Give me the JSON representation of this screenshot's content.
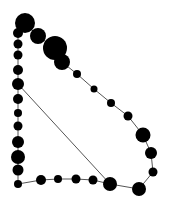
{
  "diagram": {
    "type": "node-link graph",
    "background": "#ffffff",
    "node_color": "#000000",
    "edge_color": "#555555",
    "nodes": [
      {
        "id": 0,
        "x": 25,
        "y": 23,
        "r": 10
      },
      {
        "id": 1,
        "x": 18,
        "y": 33,
        "r": 5
      },
      {
        "id": 2,
        "x": 18,
        "y": 44,
        "r": 4.5
      },
      {
        "id": 3,
        "x": 18,
        "y": 55,
        "r": 4.5
      },
      {
        "id": 4,
        "x": 18,
        "y": 70,
        "r": 5
      },
      {
        "id": 5,
        "x": 18,
        "y": 84,
        "r": 6
      },
      {
        "id": 6,
        "x": 18,
        "y": 99,
        "r": 5
      },
      {
        "id": 7,
        "x": 18,
        "y": 113,
        "r": 4
      },
      {
        "id": 8,
        "x": 18,
        "y": 126,
        "r": 4.5
      },
      {
        "id": 9,
        "x": 18,
        "y": 142,
        "r": 6
      },
      {
        "id": 10,
        "x": 18,
        "y": 157,
        "r": 7
      },
      {
        "id": 11,
        "x": 18,
        "y": 170,
        "r": 5.5
      },
      {
        "id": 12,
        "x": 18,
        "y": 184,
        "r": 4
      },
      {
        "id": 13,
        "x": 41,
        "y": 180,
        "r": 5
      },
      {
        "id": 14,
        "x": 58,
        "y": 179,
        "r": 4
      },
      {
        "id": 15,
        "x": 76,
        "y": 179,
        "r": 4.5
      },
      {
        "id": 16,
        "x": 93,
        "y": 180,
        "r": 4.5
      },
      {
        "id": 17,
        "x": 110,
        "y": 184,
        "r": 7
      },
      {
        "id": 18,
        "x": 139,
        "y": 189,
        "r": 7
      },
      {
        "id": 19,
        "x": 153,
        "y": 172,
        "r": 4.5
      },
      {
        "id": 20,
        "x": 151,
        "y": 153,
        "r": 6
      },
      {
        "id": 21,
        "x": 143,
        "y": 135,
        "r": 7.5
      },
      {
        "id": 22,
        "x": 128,
        "y": 116,
        "r": 4.5
      },
      {
        "id": 23,
        "x": 111,
        "y": 103,
        "r": 4
      },
      {
        "id": 24,
        "x": 94,
        "y": 89,
        "r": 3.5
      },
      {
        "id": 25,
        "x": 77,
        "y": 74,
        "r": 4
      },
      {
        "id": 26,
        "x": 62,
        "y": 62,
        "r": 8
      },
      {
        "id": 27,
        "x": 55,
        "y": 48,
        "r": 12
      },
      {
        "id": 28,
        "x": 38,
        "y": 36,
        "r": 8
      }
    ],
    "edges": [
      [
        0,
        1
      ],
      [
        1,
        2
      ],
      [
        2,
        3
      ],
      [
        3,
        4
      ],
      [
        4,
        5
      ],
      [
        5,
        6
      ],
      [
        6,
        7
      ],
      [
        7,
        8
      ],
      [
        8,
        9
      ],
      [
        9,
        10
      ],
      [
        10,
        11
      ],
      [
        11,
        12
      ],
      [
        12,
        13
      ],
      [
        13,
        14
      ],
      [
        14,
        15
      ],
      [
        15,
        16
      ],
      [
        16,
        17
      ],
      [
        17,
        18
      ],
      [
        18,
        19
      ],
      [
        19,
        20
      ],
      [
        20,
        21
      ],
      [
        21,
        22
      ],
      [
        22,
        23
      ],
      [
        23,
        24
      ],
      [
        24,
        25
      ],
      [
        25,
        26
      ],
      [
        26,
        27
      ],
      [
        27,
        28
      ],
      [
        28,
        0
      ],
      [
        5,
        17
      ]
    ]
  }
}
